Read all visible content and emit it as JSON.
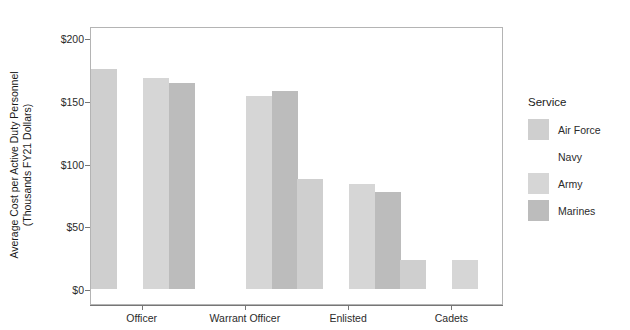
{
  "chart_data": {
    "type": "bar",
    "title": "",
    "xlabel": "",
    "ylabel_line1": "Average Cost per Active Duty Personnel",
    "ylabel_line2": "(Thousands FY21 Dollars)",
    "categories": [
      "Officer",
      "Warrant Officer",
      "Enlisted",
      "Cadets"
    ],
    "series": [
      {
        "name": "Air Force",
        "color": "#cfcfcf",
        "values": [
          175,
          null,
          88,
          23
        ]
      },
      {
        "name": "Navy",
        "color": "#ffffff",
        "values": [
          null,
          null,
          null,
          null
        ]
      },
      {
        "name": "Army",
        "color": "#d6d6d6",
        "values": [
          168,
          154,
          84,
          23
        ]
      },
      {
        "name": "Marines",
        "color": "#bcbcbc",
        "values": [
          164,
          158,
          77,
          null
        ]
      }
    ],
    "ylim": [
      0,
      212
    ],
    "yticks": [
      0,
      50,
      100,
      150,
      200
    ],
    "ytick_labels": [
      "$0",
      "$50",
      "$100",
      "$150",
      "$200"
    ],
    "grid": false,
    "legend_position": "right",
    "legend_title": "Service"
  }
}
